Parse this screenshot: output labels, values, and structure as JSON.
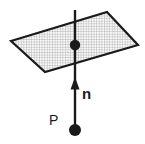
{
  "figure": {
    "background_color": "#ffffff",
    "stroke_color": "#1a1a1a",
    "plane_fill_color": "#fafafa",
    "grid_color": "#999999",
    "width": 145,
    "height": 144,
    "labels": {
      "normal_vector": "n",
      "point": "P"
    },
    "geometry": {
      "plane_corners": "11,41 107,12 138,45 45,72",
      "axis_line": {
        "x1": 75,
        "y1": 10,
        "x2": 75,
        "y2": 130
      },
      "plane_center_dot": {
        "cx": 75,
        "cy": 45,
        "r": 5
      },
      "point_dot": {
        "cx": 75,
        "cy": 130,
        "r": 6
      },
      "arrow_head": "75,77 70,89 80,89"
    },
    "label_positions": {
      "n": {
        "x": 82,
        "y": 99
      },
      "p": {
        "x": 49,
        "y": 125
      }
    }
  }
}
